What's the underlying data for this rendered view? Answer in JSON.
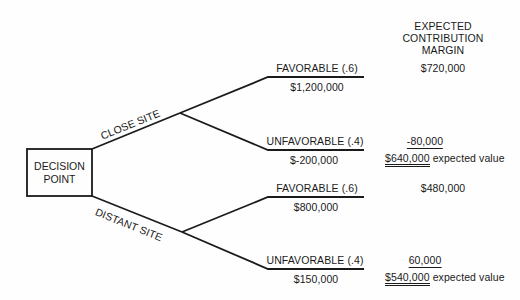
{
  "header": {
    "line1": "EXPECTED",
    "line2": "CONTRIBUTION",
    "line3": "MARGIN"
  },
  "decision_node": {
    "line1": "DECISION",
    "line2": "POINT"
  },
  "alternatives": [
    {
      "label": "CLOSE SITE",
      "outcomes": [
        {
          "label": "FAVORABLE (.6)",
          "payoff": "$1,200,000",
          "expected_contribution": "$720,000"
        },
        {
          "label": "UNFAVORABLE (.4)",
          "payoff": "$-200,000",
          "expected_contribution": "-80,000"
        }
      ],
      "expected_value": "$640,000",
      "expected_value_suffix": "expected value"
    },
    {
      "label": "DISTANT SITE",
      "outcomes": [
        {
          "label": "FAVORABLE (.6)",
          "payoff": "$800,000",
          "expected_contribution": "$480,000"
        },
        {
          "label": "UNFAVORABLE (.4)",
          "payoff": "$150,000",
          "expected_contribution": "60,000"
        }
      ],
      "expected_value": "$540,000",
      "expected_value_suffix": "expected value"
    }
  ],
  "colors": {
    "ink": "#1a1a1a",
    "background": "#fefefe"
  }
}
